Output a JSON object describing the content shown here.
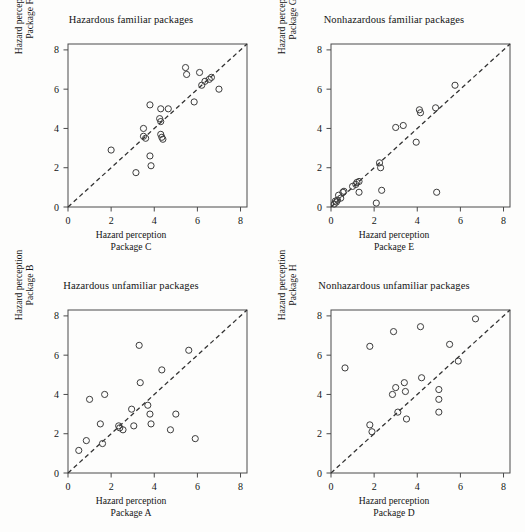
{
  "figure": {
    "background": "#fdfdfc",
    "axis_color": "#4a4a4a",
    "marker_color": "#3c3c3c",
    "reference_line_color": "#333333",
    "panel_count": 4
  },
  "axis": {
    "ticks": [
      "0",
      "2",
      "4",
      "6",
      "8"
    ],
    "tick_values": [
      0,
      2,
      4,
      6,
      8
    ],
    "min": 0,
    "max": 8.3
  },
  "chart_data": [
    {
      "type": "scatter",
      "panel": "top-left",
      "title": "Hazardous familiar packages",
      "xlabel": "Hazard perception",
      "xlabel_line2": "Package C",
      "ylabel": "Hazard perception",
      "ylabel_line2": "Package F",
      "xlim": [
        0,
        8.3
      ],
      "ylim": [
        0,
        8.3
      ],
      "xticks": [
        0,
        2,
        4,
        6,
        8
      ],
      "yticks": [
        0,
        2,
        4,
        6,
        8
      ],
      "grid": false,
      "legend": "none",
      "reference_line": {
        "type": "identity",
        "style": "dashed",
        "from": [
          0,
          0
        ],
        "to": [
          8.3,
          8.3
        ]
      },
      "points": [
        [
          2.0,
          2.9
        ],
        [
          3.15,
          1.75
        ],
        [
          3.5,
          4.0
        ],
        [
          3.5,
          3.6
        ],
        [
          3.6,
          3.5
        ],
        [
          3.8,
          5.2
        ],
        [
          3.8,
          2.6
        ],
        [
          3.85,
          2.1
        ],
        [
          4.25,
          4.5
        ],
        [
          4.3,
          4.35
        ],
        [
          4.3,
          5.0
        ],
        [
          4.3,
          3.7
        ],
        [
          4.35,
          3.55
        ],
        [
          4.4,
          3.45
        ],
        [
          4.65,
          5.0
        ],
        [
          5.45,
          7.1
        ],
        [
          5.5,
          6.75
        ],
        [
          5.85,
          5.35
        ],
        [
          6.1,
          6.85
        ],
        [
          6.2,
          6.2
        ],
        [
          6.35,
          6.4
        ],
        [
          6.55,
          6.5
        ],
        [
          6.65,
          6.6
        ],
        [
          7.0,
          6.0
        ]
      ]
    },
    {
      "type": "scatter",
      "panel": "top-right",
      "title": "Nonhazardous familiar packages",
      "xlabel": "Hazard perception",
      "xlabel_line2": "Package E",
      "ylabel": "Hazard perception",
      "ylabel_line2": "Package G",
      "xlim": [
        0,
        8.3
      ],
      "ylim": [
        0,
        8.3
      ],
      "xticks": [
        0,
        2,
        4,
        6,
        8
      ],
      "yticks": [
        0,
        2,
        4,
        6,
        8
      ],
      "grid": false,
      "legend": "none",
      "reference_line": {
        "type": "identity",
        "style": "dashed",
        "from": [
          0,
          0
        ],
        "to": [
          8.3,
          8.3
        ]
      },
      "points": [
        [
          0.15,
          0.15
        ],
        [
          0.2,
          0.3
        ],
        [
          0.25,
          0.25
        ],
        [
          0.3,
          0.35
        ],
        [
          0.35,
          0.6
        ],
        [
          0.45,
          0.45
        ],
        [
          0.55,
          0.75
        ],
        [
          0.6,
          0.8
        ],
        [
          1.0,
          1.05
        ],
        [
          1.15,
          1.15
        ],
        [
          1.2,
          1.25
        ],
        [
          1.3,
          1.3
        ],
        [
          1.3,
          0.75
        ],
        [
          2.1,
          0.2
        ],
        [
          2.25,
          2.25
        ],
        [
          2.3,
          2.0
        ],
        [
          2.35,
          0.85
        ],
        [
          3.0,
          4.05
        ],
        [
          3.35,
          4.15
        ],
        [
          3.95,
          3.3
        ],
        [
          4.1,
          4.95
        ],
        [
          4.15,
          4.8
        ],
        [
          4.85,
          5.05
        ],
        [
          4.9,
          0.75
        ],
        [
          5.75,
          6.2
        ]
      ]
    },
    {
      "type": "scatter",
      "panel": "bottom-left",
      "title": "Hazardous unfamiliar packages",
      "xlabel": "Hazard perception",
      "xlabel_line2": "Package A",
      "ylabel": "Hazard perception",
      "ylabel_line2": "Package B",
      "xlim": [
        0,
        8.3
      ],
      "ylim": [
        0,
        8.3
      ],
      "xticks": [
        0,
        2,
        4,
        6,
        8
      ],
      "yticks": [
        0,
        2,
        4,
        6,
        8
      ],
      "grid": false,
      "legend": "none",
      "reference_line": {
        "type": "identity",
        "style": "dashed",
        "from": [
          0,
          0
        ],
        "to": [
          8.3,
          8.3
        ]
      },
      "points": [
        [
          0.5,
          1.15
        ],
        [
          0.85,
          1.65
        ],
        [
          1.0,
          3.75
        ],
        [
          1.5,
          2.5
        ],
        [
          1.6,
          1.5
        ],
        [
          1.7,
          4.0
        ],
        [
          2.35,
          2.4
        ],
        [
          2.4,
          2.3
        ],
        [
          2.55,
          2.2
        ],
        [
          2.95,
          3.25
        ],
        [
          3.05,
          2.4
        ],
        [
          3.3,
          6.5
        ],
        [
          3.35,
          4.6
        ],
        [
          3.7,
          3.45
        ],
        [
          3.8,
          3.0
        ],
        [
          3.85,
          2.5
        ],
        [
          4.35,
          5.25
        ],
        [
          4.75,
          2.2
        ],
        [
          5.0,
          3.0
        ],
        [
          5.6,
          6.25
        ],
        [
          5.9,
          1.75
        ]
      ]
    },
    {
      "type": "scatter",
      "panel": "bottom-right",
      "title": "Nonhazardous unfamiliar packages",
      "xlabel": "Hazard perception",
      "xlabel_line2": "Package D",
      "ylabel": "Hazard perception",
      "ylabel_line2": "Package H",
      "xlim": [
        0,
        8.3
      ],
      "ylim": [
        0,
        8.3
      ],
      "xticks": [
        0,
        2,
        4,
        6,
        8
      ],
      "yticks": [
        0,
        2,
        4,
        6,
        8
      ],
      "grid": false,
      "legend": "none",
      "reference_line": {
        "type": "identity",
        "style": "dashed",
        "from": [
          0,
          0
        ],
        "to": [
          8.3,
          8.3
        ]
      },
      "points": [
        [
          0.65,
          5.35
        ],
        [
          1.8,
          6.45
        ],
        [
          1.8,
          2.45
        ],
        [
          1.9,
          2.1
        ],
        [
          2.85,
          4.0
        ],
        [
          2.9,
          7.2
        ],
        [
          3.0,
          4.35
        ],
        [
          3.1,
          3.1
        ],
        [
          3.4,
          4.6
        ],
        [
          3.45,
          4.15
        ],
        [
          3.5,
          2.75
        ],
        [
          4.15,
          7.45
        ],
        [
          4.2,
          4.85
        ],
        [
          5.0,
          4.25
        ],
        [
          5.0,
          3.75
        ],
        [
          5.0,
          3.1
        ],
        [
          5.5,
          6.55
        ],
        [
          5.9,
          5.7
        ],
        [
          6.7,
          7.85
        ]
      ]
    }
  ]
}
